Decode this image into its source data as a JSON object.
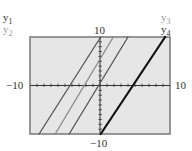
{
  "chart_data": {
    "type": "line",
    "title": "",
    "xlabel": "",
    "ylabel": "",
    "xlim": [
      -10,
      10
    ],
    "ylim": [
      -10,
      10
    ],
    "grid": false,
    "tick_labels": {
      "x_min": "−10",
      "x_max": "10",
      "y_min": "−10",
      "y_max": "10"
    },
    "legend": {
      "left": [
        "y1",
        "y2"
      ],
      "right": [
        "y3",
        "y4"
      ]
    },
    "series": [
      {
        "name": "y1",
        "slope": 2,
        "intercept": 10,
        "points": [
          [
            -8.7,
            -10
          ],
          [
            0.1,
            10
          ]
        ],
        "color": "#555555",
        "width": 1.3
      },
      {
        "name": "y2",
        "slope": 2,
        "intercept": 5,
        "points": [
          [
            -6.4,
            -10
          ],
          [
            1.9,
            10
          ]
        ],
        "color": "#888888",
        "width": 1.3
      },
      {
        "name": "y3",
        "slope": 2,
        "intercept": 0,
        "points": [
          [
            -4.4,
            -10
          ],
          [
            4.0,
            10
          ]
        ],
        "color": "#555555",
        "width": 1.3
      },
      {
        "name": "y4",
        "slope": 2,
        "intercept": -10,
        "points": [
          [
            0.1,
            -10
          ],
          [
            9.3,
            10
          ]
        ],
        "color": "#111111",
        "width": 2.2
      }
    ],
    "axis_tick_step": 1
  },
  "labels": {
    "y1": "y",
    "y1_sub": "1",
    "y2": "y",
    "y2_sub": "2",
    "y3": "y",
    "y3_sub": "3",
    "y4": "y",
    "y4_sub": "4",
    "x_min": "−10",
    "x_max": "10",
    "y_max": "10",
    "y_min": "−10"
  },
  "colors": {
    "screen_bg": "#e6e6e6",
    "frame": "#777777",
    "axis": "#333333"
  }
}
